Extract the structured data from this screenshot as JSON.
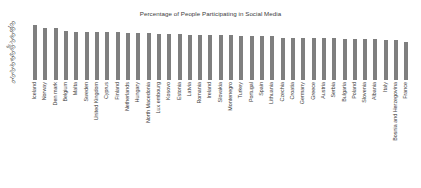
{
  "chart_data": {
    "type": "bar",
    "title": "Percentage of People Participating in Social Media",
    "xlabel": "",
    "ylabel": "%",
    "ylim": [
      0,
      100
    ],
    "yticks": [
      100,
      90,
      80,
      70,
      60,
      50,
      40,
      30,
      20,
      10,
      0
    ],
    "grid": false,
    "legend": null,
    "bar_color": "#7f7f7f",
    "categories": [
      "Iceland",
      "Norway",
      "Den mark",
      "Belgium",
      "Malta",
      "Sweden",
      "United Kingdom",
      "Cyprus",
      "Finland",
      "Netherlands",
      "Hungary",
      "North Macedonia",
      "Lux embourg",
      "Kosovo",
      "Estonia",
      "Latvia",
      "Romania",
      "Ireland",
      "Slovakia",
      "Montenegro",
      "Turkey",
      "Portugal",
      "Spain",
      "Lithuania",
      "Czechia",
      "Croatia",
      "Germany",
      "Greece",
      "Austria",
      "Serbia",
      "Bulgaria",
      "Poland",
      "Slovenia",
      "Albania",
      "Italy",
      "Bosnia and Herzegovina",
      "France"
    ],
    "values": [
      94,
      89,
      88,
      83,
      82,
      82,
      82,
      81,
      81,
      80,
      79,
      79,
      78,
      78,
      78,
      77,
      77,
      77,
      76,
      76,
      75,
      75,
      75,
      75,
      72,
      72,
      72,
      71,
      71,
      71,
      70,
      70,
      70,
      69,
      68,
      68,
      64
    ]
  }
}
